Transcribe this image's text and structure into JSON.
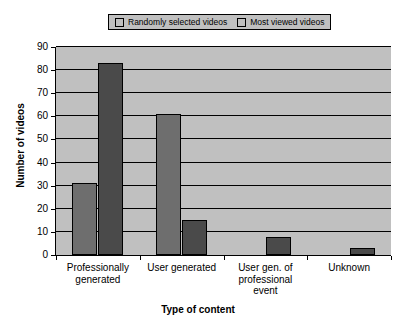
{
  "chart_data": {
    "type": "bar",
    "title": "",
    "xlabel": "Type of content",
    "ylabel": "Number of videos",
    "categories": [
      "Professionally generated",
      "User generated",
      "User gen. of professional event",
      "Unknown"
    ],
    "category_lines": [
      [
        "Professionally",
        "generated"
      ],
      [
        "User generated"
      ],
      [
        "User gen. of",
        "professional",
        "event"
      ],
      [
        "Unknown"
      ]
    ],
    "series": [
      {
        "name": "Randomly selected videos",
        "color": "#6e6e6e",
        "values": [
          31,
          61,
          0,
          0
        ]
      },
      {
        "name": "Most viewed videos",
        "color": "#4a4a4a",
        "values": [
          83,
          15,
          8,
          3
        ]
      }
    ],
    "ylim": [
      0,
      90
    ],
    "yticks": [
      0,
      10,
      20,
      30,
      40,
      50,
      60,
      70,
      80,
      90
    ],
    "ytick_labels": [
      "0",
      "10",
      "20",
      "30",
      "40",
      "50",
      "60",
      "70",
      "80",
      "90"
    ],
    "grid": true,
    "grid_axis": "y",
    "legend_position": "top",
    "plot_background": "#c0c0c0"
  },
  "legend": {
    "entries": [
      {
        "label": "Randomly selected videos"
      },
      {
        "label": "Most viewed videos"
      }
    ]
  }
}
